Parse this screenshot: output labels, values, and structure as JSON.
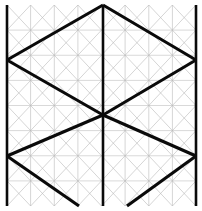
{
  "figure": {
    "type": "geometric-line-diagram",
    "canvas": {
      "width": 202,
      "height": 211
    },
    "background_color": "#ffffff"
  },
  "colors": {
    "grid_diagonal": "#b8b8b8",
    "grid_horizontal": "#c9c9c9",
    "heavy_path": "#0a0a0a",
    "frame": "#0a0a0a"
  },
  "geometry": {
    "bounds": {
      "x0": 7,
      "y0": 5,
      "x1": 196,
      "y1": 206
    },
    "grid": {
      "columns": 8,
      "rows": 8,
      "cell_width": 23.625,
      "cell_height": 25.125,
      "description": "Isometric triangular lattice: horizontal rules plus alternating up/down diagonals"
    },
    "key_points": {
      "top_apex": [
        103,
        5
      ],
      "left_upper_vertex": [
        7,
        60
      ],
      "right_upper_vertex": [
        196,
        60
      ],
      "center": [
        103,
        115
      ],
      "left_lower_vertex": [
        7,
        156
      ],
      "right_lower_vertex": [
        196,
        156
      ],
      "bottom_left_foot": [
        79,
        206
      ],
      "bottom_right_foot": [
        127,
        206
      ]
    }
  },
  "grid_data": {
    "horizontal_lines_y": [
      5,
      30.1,
      55.25,
      80.4,
      105.5,
      130.6,
      155.75,
      180.9,
      206
    ],
    "vertical_columns_x": [
      7,
      30.6,
      54.3,
      77.9,
      101.5,
      125.1,
      148.8,
      172.4,
      196
    ]
  },
  "heavy_paths": [
    {
      "name": "upper-left-wing",
      "points": [
        [
          103,
          5
        ],
        [
          7,
          60
        ]
      ]
    },
    {
      "name": "upper-right-wing",
      "points": [
        [
          103,
          5
        ],
        [
          196,
          60
        ]
      ]
    },
    {
      "name": "left-descending-to-center",
      "points": [
        [
          7,
          60
        ],
        [
          103,
          115
        ]
      ]
    },
    {
      "name": "right-ascending-from-center",
      "points": [
        [
          196,
          60
        ],
        [
          103,
          115
        ]
      ]
    },
    {
      "name": "center-to-left-lower",
      "points": [
        [
          103,
          115
        ],
        [
          7,
          156
        ]
      ]
    },
    {
      "name": "center-to-right-lower",
      "points": [
        [
          103,
          115
        ],
        [
          196,
          156
        ]
      ]
    },
    {
      "name": "left-lower-foot",
      "points": [
        [
          7,
          156
        ],
        [
          79,
          206
        ]
      ]
    },
    {
      "name": "right-lower-foot",
      "points": [
        [
          196,
          156
        ],
        [
          127,
          206
        ]
      ]
    }
  ],
  "frame_lines": [
    {
      "name": "left-border",
      "points": [
        [
          7,
          5
        ],
        [
          7,
          206
        ]
      ]
    },
    {
      "name": "center-axis",
      "points": [
        [
          103,
          5
        ],
        [
          103,
          206
        ]
      ]
    },
    {
      "name": "right-border",
      "points": [
        [
          196,
          5
        ],
        [
          196,
          206
        ]
      ]
    }
  ],
  "labels": {
    "axis_labels": [],
    "annotations": [],
    "legend": []
  }
}
